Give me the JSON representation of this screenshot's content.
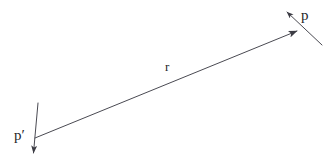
{
  "figure": {
    "background_color": "#ffffff",
    "stroke_color": "#4a4a52",
    "label_color": "#26262b",
    "width": 336,
    "height": 165,
    "labels": {
      "vector": "r",
      "point_head": "p",
      "point_tail": "p′"
    },
    "elements": [
      {
        "name": "vector-r",
        "kind": "arrow",
        "from": [
          35,
          138
        ],
        "to": [
          297,
          31
        ],
        "label": "r"
      },
      {
        "name": "line-p",
        "kind": "arrow",
        "from": [
          322,
          45
        ],
        "to": [
          286,
          11
        ],
        "label": "p"
      },
      {
        "name": "line-p-prime",
        "kind": "arrow",
        "from": [
          38,
          103
        ],
        "to": [
          33,
          156
        ],
        "label": "p′"
      }
    ]
  }
}
